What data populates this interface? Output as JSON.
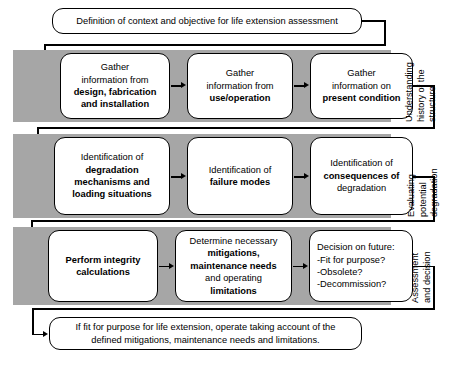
{
  "diagram": {
    "title_box": {
      "text": "Definition of context and objective for life extension assessment"
    },
    "phases": [
      {
        "label": "Understanding\nhistory of the\nstructure",
        "steps": [
          {
            "line1": "Gather",
            "line2": "information from",
            "line3": "design, fabrication",
            "line4": "and installation"
          },
          {
            "line1": "Gather",
            "line2": "information from",
            "line3": "use/operation",
            "line4": ""
          },
          {
            "line1": "Gather",
            "line2": "information on",
            "line3": "present condition",
            "line4": ""
          }
        ]
      },
      {
        "label": "Evaluating\npotential\ndegradation",
        "steps": [
          {
            "line1": "Identification of",
            "line2": "degradation",
            "line3": "mechanisms and",
            "line4": "loading situations"
          },
          {
            "line1": "Identification of",
            "line2": "failure modes",
            "line3": "",
            "line4": ""
          },
          {
            "line1": "Identification of",
            "line2": "consequences of",
            "line3": "degradation",
            "line4": ""
          }
        ]
      },
      {
        "label": "Assessment\nand decision",
        "steps": [
          {
            "line1": "Perform integrity",
            "line2": "calculations",
            "line3": "",
            "line4": ""
          },
          {
            "line1": "Determine necessary",
            "line2": "mitigations,",
            "line3": "maintenance needs",
            "line4": "and operating",
            "line5": "limitations"
          },
          {
            "line1": "Decision on future:",
            "line2": "-Fit for purpose?",
            "line3": "-Obsolete?",
            "line4": "-Decommission?"
          }
        ]
      }
    ],
    "outcome_box": {
      "line1": "If fit for purpose for life extension, operate taking account of the",
      "line2": "defined mitigations, maintenance needs and limitations."
    },
    "colors": {
      "band": "#a6a6a6",
      "box_fill": "#ffffff",
      "stroke": "#000000",
      "page": "#ffffff"
    }
  }
}
